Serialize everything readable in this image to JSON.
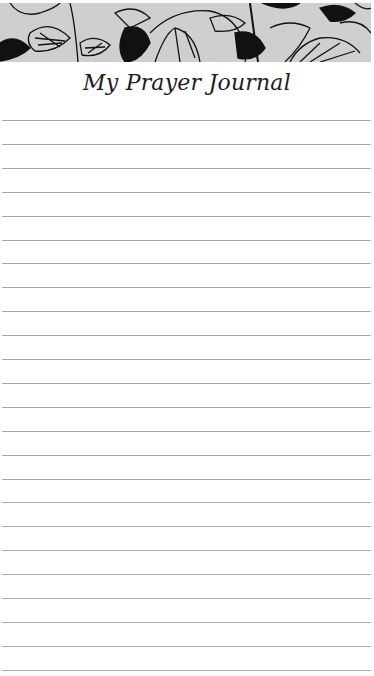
{
  "page": {
    "title": "My Prayer Journal",
    "banner_icon": "floral-line-art-banner",
    "ruled_line_count": 24,
    "ruled_line_start_y": 0,
    "ruled_line_spacing": 23.9,
    "line_color": "#a9a9a9",
    "banner_color": "#c9c9c9"
  }
}
